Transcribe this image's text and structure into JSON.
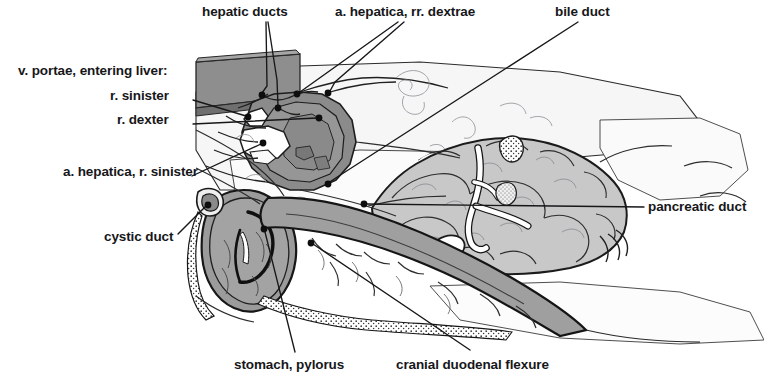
{
  "figure": {
    "background_color": "#ffffff",
    "ink_color": "#17171a",
    "tones": {
      "cut_surface_dark_gray": "#8c8c8c",
      "liver_mid_gray": "#8f8f8f",
      "stomach_gray": "#9a9a9a",
      "pancreas_light_gray": "#c9c9c9",
      "duodenum_gray": "#a5a5a5",
      "pale_fascia": "#f2f2f2",
      "white_highlight": "#ffffff"
    },
    "labels": [
      {
        "id": "hepatic-ducts",
        "text": "hepatic ducts",
        "x": 202,
        "y": 5,
        "align": "left",
        "leaders": [
          {
            "path": "M 266 22 L 267 86 L 262 93"
          },
          {
            "path": "M 268 22 L 277 80 L 278 106"
          }
        ],
        "dots": [
          {
            "x": 262,
            "y": 95
          },
          {
            "x": 278,
            "y": 108
          }
        ]
      },
      {
        "id": "a-hepatica-rr-dextrae",
        "text": "a. hepatica, rr. dextrae",
        "x": 335,
        "y": 5,
        "align": "left",
        "leaders": [
          {
            "path": "M 398 22 L 300 92"
          },
          {
            "path": "M 404 22 L 335 82 L 330 91"
          }
        ],
        "dots": [
          {
            "x": 297,
            "y": 94
          },
          {
            "x": 328,
            "y": 93
          }
        ]
      },
      {
        "id": "bile-duct",
        "text": "bile duct",
        "x": 555,
        "y": 5,
        "align": "left",
        "leaders": [
          {
            "path": "M 578 22 L 328 183"
          }
        ],
        "dots": [
          {
            "x": 328,
            "y": 184
          }
        ]
      },
      {
        "id": "v-portae-entering-liver",
        "text": "v. portae, entering liver:",
        "x": 18,
        "y": 64,
        "align": "left",
        "leaders": [],
        "dots": []
      },
      {
        "id": "r-sinister",
        "text": "r. sinister",
        "x": 110,
        "y": 89,
        "align": "left",
        "leaders": [
          {
            "path": "M 193 100 L 246 116"
          }
        ],
        "dots": [
          {
            "x": 248,
            "y": 117
          }
        ]
      },
      {
        "id": "r-dexter",
        "text": "r. dexter",
        "x": 117,
        "y": 113,
        "align": "left",
        "leaders": [
          {
            "path": "M 193 124 L 317 118"
          }
        ],
        "dots": [
          {
            "x": 319,
            "y": 118
          }
        ]
      },
      {
        "id": "a-hepatica-r-sinister",
        "text": "a. hepatica, r. sinister",
        "x": 63,
        "y": 165,
        "align": "left",
        "leaders": [
          {
            "path": "M 192 176 L 261 144"
          }
        ],
        "dots": [
          {
            "x": 263,
            "y": 143
          }
        ]
      },
      {
        "id": "cystic-duct",
        "text": "cystic duct",
        "x": 104,
        "y": 230,
        "align": "left",
        "leaders": [
          {
            "path": "M 178 234 L 206 206"
          }
        ],
        "dots": [
          {
            "x": 208,
            "y": 205
          }
        ]
      },
      {
        "id": "pancreatic-duct",
        "text": "pancreatic duct",
        "x": 648,
        "y": 200,
        "align": "left",
        "leaders": [
          {
            "path": "M 644 207 L 366 204"
          }
        ],
        "dots": [
          {
            "x": 364,
            "y": 204
          }
        ]
      },
      {
        "id": "stomach-pylorus",
        "text": "stomach, pylorus",
        "x": 234,
        "y": 358,
        "align": "left",
        "leaders": [
          {
            "path": "M 295 352 L 265 232"
          }
        ],
        "dots": [
          {
            "x": 264,
            "y": 229
          }
        ]
      },
      {
        "id": "cranial-duodenal-flexure",
        "text": "cranial duodenal flexure",
        "x": 396,
        "y": 358,
        "align": "left",
        "leaders": [
          {
            "path": "M 470 350 L 313 244"
          }
        ],
        "dots": [
          {
            "x": 311,
            "y": 243
          }
        ]
      }
    ]
  }
}
